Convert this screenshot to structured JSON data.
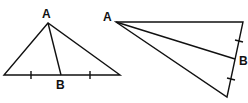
{
  "figures": [
    {
      "name": "left-triangle",
      "labels": {
        "apex": "A",
        "base_point": "B"
      }
    },
    {
      "name": "right-triangle",
      "labels": {
        "apex": "A",
        "side_point": "B"
      }
    }
  ],
  "colors": {
    "stroke": "#111111",
    "background": "#ffffff"
  }
}
